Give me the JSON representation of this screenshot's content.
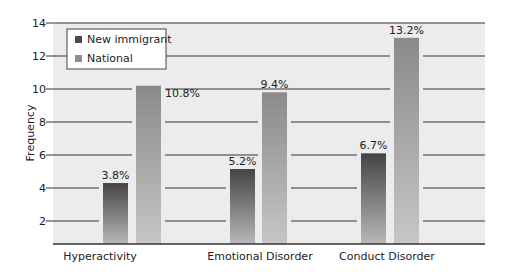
{
  "chart_data": {
    "type": "bar",
    "title": "",
    "xlabel": "",
    "ylabel": "Frequency",
    "ylim": [
      0.6,
      14
    ],
    "yticks": [
      2,
      4,
      6,
      8,
      10,
      12,
      14
    ],
    "grid": true,
    "legend_position": "top-left",
    "categories": [
      "Hyperactivity",
      "Emotional Disorder",
      "Conduct Disorder"
    ],
    "series": [
      {
        "name": "New immigrant",
        "color": "#4a4a4a",
        "values": [
          3.8,
          5.2,
          6.7
        ],
        "plotted_heights": [
          4.3,
          5.15,
          6.1
        ],
        "labels": [
          "3.8%",
          "5.2%",
          "6.7%"
        ]
      },
      {
        "name": "National",
        "color": "#8e8e8e",
        "values": [
          10.8,
          9.4,
          13.2
        ],
        "plotted_heights": [
          10.2,
          9.8,
          13.1
        ],
        "labels": [
          "10.8%",
          "9.4%",
          "13.2%"
        ]
      }
    ]
  },
  "colors": {
    "plot_background": "#ececec",
    "gridline": "#333333",
    "dark_bar_top": "#444444",
    "dark_bar_bottom": "#b5b5b5",
    "light_bar_top": "#8c8c8c",
    "light_bar_bottom": "#c4c4c4"
  }
}
